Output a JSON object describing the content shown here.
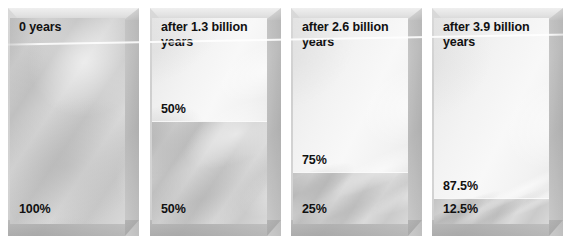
{
  "figure": {
    "colors": {
      "parent_material": "#c9c9c9",
      "daughter_material": "#f2f2f2",
      "label_text": "#111111",
      "background": "#ffffff"
    }
  },
  "chart_data": {
    "type": "bar",
    "xlabel": "",
    "ylabel": "",
    "categories": [
      "0 years",
      "after 1.3 billion years",
      "after 2.6 billion years",
      "after 3.9 billion years"
    ],
    "series": [
      {
        "name": "parent (remaining)",
        "values": [
          100,
          50,
          25,
          12.5
        ],
        "unit": "%"
      },
      {
        "name": "daughter (decayed)",
        "values": [
          0,
          50,
          75,
          87.5
        ],
        "unit": "%"
      }
    ],
    "ylim": [
      0,
      100
    ],
    "grid": false,
    "legend": "none"
  },
  "panels": [
    {
      "time_label": "0 years",
      "parent_percent_label": "100%",
      "daughter_percent_label": "",
      "parent_fraction": 1.0,
      "daughter_fraction": 0.0
    },
    {
      "time_label": "after 1.3 billion\nyears",
      "parent_percent_label": "50%",
      "daughter_percent_label": "50%",
      "parent_fraction": 0.5,
      "daughter_fraction": 0.5
    },
    {
      "time_label": "after 2.6 billion\nyears",
      "parent_percent_label": "25%",
      "daughter_percent_label": "75%",
      "parent_fraction": 0.25,
      "daughter_fraction": 0.75
    },
    {
      "time_label": "after 3.9 billion\nyears",
      "parent_percent_label": "12.5%",
      "daughter_percent_label": "87.5%",
      "parent_fraction": 0.125,
      "daughter_fraction": 0.875
    }
  ]
}
